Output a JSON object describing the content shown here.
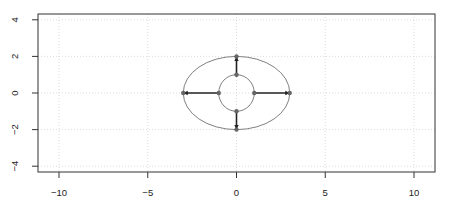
{
  "chart_data": {
    "type": "scatter",
    "title": "",
    "xlabel": "",
    "ylabel": "",
    "xlim": [
      -11.2,
      11.2
    ],
    "ylim": [
      -4.3,
      4.3
    ],
    "grid": true,
    "x_ticks": [
      -10,
      -5,
      0,
      5,
      10
    ],
    "y_ticks": [
      -4,
      -2,
      0,
      2,
      4
    ],
    "x_tick_labels": [
      "-10",
      "-5",
      "0",
      "5",
      "10"
    ],
    "y_tick_labels": [
      "-4",
      "-2",
      "0",
      "2",
      "4"
    ],
    "shapes": [
      {
        "kind": "circle",
        "cx": 0,
        "cy": 0,
        "rx": 1,
        "ry": 1,
        "color": "#808080"
      },
      {
        "kind": "ellipse",
        "cx": 0,
        "cy": 0,
        "rx": 3,
        "ry": 2,
        "color": "#808080"
      }
    ],
    "points": [
      {
        "x": 1,
        "y": 0
      },
      {
        "x": 0,
        "y": 1
      },
      {
        "x": -1,
        "y": 0
      },
      {
        "x": 0,
        "y": -1
      },
      {
        "x": 3,
        "y": 0
      },
      {
        "x": 0,
        "y": 2
      },
      {
        "x": -3,
        "y": 0
      },
      {
        "x": 0,
        "y": -2
      }
    ],
    "arrows": [
      {
        "from": [
          1,
          0
        ],
        "to": [
          3,
          0
        ]
      },
      {
        "from": [
          0,
          1
        ],
        "to": [
          0,
          2
        ]
      },
      {
        "from": [
          -1,
          0
        ],
        "to": [
          -3,
          0
        ]
      },
      {
        "from": [
          0,
          -1
        ],
        "to": [
          0,
          -2
        ]
      }
    ],
    "colors": {
      "axis": "#333333",
      "grid": "#d3d3d3",
      "shape": "#808080",
      "point": "#666666",
      "arrow": "#222222"
    }
  }
}
